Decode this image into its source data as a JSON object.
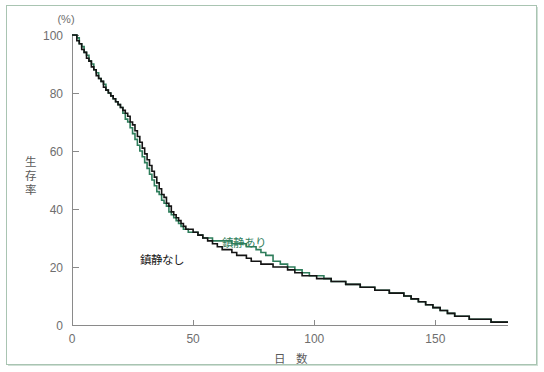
{
  "figure": {
    "frame_color": "#a9c4b2",
    "background": "#ffffff"
  },
  "chart_data": {
    "type": "line",
    "title": "",
    "subtitle": "",
    "xlabel": "日　数",
    "ylabel": "生存率",
    "yunit": "(%)",
    "xlim": [
      0,
      180
    ],
    "ylim": [
      0,
      100
    ],
    "xticks": [
      0,
      50,
      100,
      150
    ],
    "xtick_labels": [
      "0",
      "50",
      "100",
      "150"
    ],
    "yticks": [
      0,
      20,
      40,
      60,
      80,
      100
    ],
    "ytick_labels": [
      "0",
      "20",
      "40",
      "60",
      "80",
      "100"
    ],
    "grid": false,
    "legend_position": "inline-annotation",
    "step_shape": "hv",
    "series": [
      {
        "name": "鎮静あり",
        "label": "鎮静あり",
        "color": "#2e7d5b",
        "width": 1.6,
        "label_x": 62,
        "label_y": 27,
        "x": [
          0,
          2,
          3,
          4,
          5,
          6,
          7,
          8,
          9,
          10,
          11,
          12,
          13,
          14,
          15,
          16,
          17,
          18,
          19,
          20,
          21,
          22,
          23,
          24,
          25,
          26,
          27,
          28,
          29,
          30,
          31,
          32,
          33,
          34,
          35,
          36,
          37,
          38,
          39,
          40,
          41,
          42,
          43,
          44,
          45,
          46,
          47,
          48,
          50,
          52,
          54,
          56,
          58,
          60,
          62,
          64,
          66,
          68,
          70,
          72,
          74,
          76,
          78,
          80,
          83,
          86,
          89,
          92,
          95,
          98,
          101,
          104,
          107,
          110,
          113,
          116,
          119,
          122,
          125,
          128,
          131,
          134,
          137,
          140,
          143,
          146,
          149,
          152,
          155,
          158,
          161,
          164,
          167,
          170,
          173,
          176,
          180
        ],
        "y": [
          100,
          99,
          97,
          96,
          94,
          93,
          91,
          90,
          88,
          87,
          85,
          84,
          83,
          81,
          80,
          79,
          78,
          77,
          76,
          75,
          73,
          71,
          70,
          68,
          66,
          64,
          62,
          60,
          58,
          56,
          54,
          52,
          50,
          48,
          46,
          45,
          43,
          42,
          41,
          39,
          38,
          37,
          36,
          35,
          34,
          33,
          33,
          32,
          32,
          31,
          30,
          30,
          29,
          29,
          29,
          29,
          28,
          28,
          28,
          27,
          27,
          26,
          25,
          24,
          22,
          21,
          20,
          19,
          18,
          17,
          17,
          16,
          15,
          15,
          14,
          14,
          13,
          13,
          12,
          12,
          11,
          11,
          10,
          9,
          8,
          7,
          6,
          5,
          4,
          3,
          3,
          2,
          2,
          2,
          1,
          1,
          1
        ]
      },
      {
        "name": "鎮静なし",
        "label": "鎮静なし",
        "color": "#141414",
        "width": 1.6,
        "label_x": 28,
        "label_y": 21,
        "x": [
          0,
          2,
          3,
          4,
          5,
          6,
          7,
          8,
          9,
          10,
          11,
          12,
          13,
          14,
          15,
          16,
          17,
          18,
          19,
          20,
          21,
          22,
          23,
          24,
          25,
          26,
          27,
          28,
          29,
          30,
          31,
          32,
          33,
          34,
          35,
          36,
          37,
          38,
          39,
          40,
          41,
          42,
          43,
          44,
          45,
          46,
          47,
          48,
          50,
          52,
          54,
          56,
          58,
          60,
          62,
          64,
          66,
          68,
          70,
          72,
          74,
          76,
          78,
          80,
          83,
          86,
          89,
          92,
          95,
          98,
          101,
          104,
          107,
          110,
          113,
          116,
          119,
          122,
          125,
          128,
          131,
          134,
          137,
          140,
          143,
          146,
          149,
          152,
          155,
          158,
          161,
          164,
          167,
          170,
          173,
          176,
          180
        ],
        "y": [
          100,
          98,
          97,
          95,
          94,
          92,
          91,
          89,
          88,
          86,
          85,
          84,
          82,
          81,
          80,
          79,
          78,
          77,
          76,
          75,
          74,
          73,
          72,
          70,
          69,
          67,
          65,
          63,
          61,
          59,
          57,
          55,
          53,
          51,
          49,
          47,
          45,
          44,
          42,
          41,
          39,
          38,
          37,
          36,
          35,
          34,
          33,
          33,
          32,
          31,
          30,
          29,
          28,
          27,
          26,
          26,
          25,
          24,
          24,
          23,
          22,
          22,
          21,
          21,
          20,
          20,
          19,
          18,
          17,
          17,
          16,
          16,
          15,
          15,
          14,
          14,
          13,
          13,
          12,
          12,
          11,
          11,
          10,
          9,
          8,
          7,
          6,
          5,
          4,
          3,
          3,
          2,
          2,
          2,
          1,
          1,
          1
        ]
      }
    ]
  }
}
